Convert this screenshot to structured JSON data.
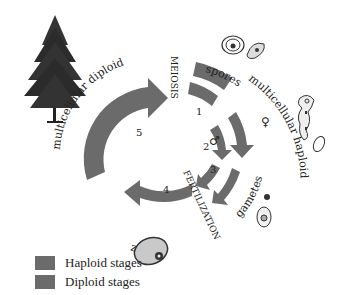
{
  "diagram": {
    "type": "life-cycle",
    "stage_labels": {
      "spores": "spores",
      "multicellular_haploid": "multicellular haploid",
      "gametes": "gametes",
      "zygote": "zygote",
      "multicellular_diploid": "multicellular diploid"
    },
    "process_labels": {
      "meiosis": "MEIOSIS",
      "fertilization": "FERTILIZATION"
    },
    "step_numbers": [
      "1",
      "2",
      "3",
      "4",
      "5"
    ],
    "sex_symbols": {
      "male": "♂",
      "female": "♀"
    },
    "colors": {
      "haploid": "#6b6b6b",
      "diploid": "#6b6b6b",
      "text": "#222222"
    }
  },
  "legend": {
    "items": [
      {
        "label": "Haploid stages",
        "color": "#6b6b6b"
      },
      {
        "label": "Diploid stages",
        "color": "#6b6b6b"
      }
    ]
  }
}
